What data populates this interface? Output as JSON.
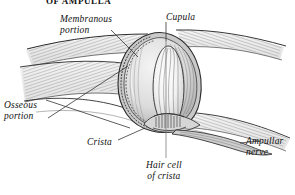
{
  "figure": {
    "title": "OF AMPULLA",
    "type": "anatomical-illustration",
    "background_color": "#ffffff",
    "ink_color": "#1a1a1a"
  },
  "labels": {
    "membranous_portion": "Membranous\nportion",
    "membranous_portion_l1": "Membranous",
    "membranous_portion_l2": "portion",
    "cupula": "Cupula",
    "osseous_portion_l1": "Osseous",
    "osseous_portion_l2": "portion",
    "crista": "Crista",
    "hair_cell_l1": "Hair cell",
    "hair_cell_l2": "of crista",
    "ampullar_nerve_l1": "Ampullar",
    "ampullar_nerve_l2": "nerve"
  }
}
